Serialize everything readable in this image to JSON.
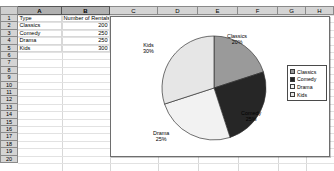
{
  "spreadsheet": {
    "column_headers": [
      "A",
      "B",
      "C",
      "D",
      "E",
      "F",
      "G",
      "H"
    ],
    "selected_columns": [
      "A",
      "B"
    ],
    "row_headers": [
      "1",
      "2",
      "3",
      "4",
      "5",
      "6",
      "7",
      "8",
      "9",
      "10",
      "11",
      "12",
      "13",
      "14",
      "15",
      "16",
      "17",
      "18",
      "19",
      "20"
    ],
    "cells": [
      {
        "row": "1",
        "a": "Type",
        "b": "Number of Rentals"
      },
      {
        "row": "2",
        "a": "Classics",
        "b": "200"
      },
      {
        "row": "3",
        "a": "Comedy",
        "b": "250"
      },
      {
        "row": "4",
        "a": "Drama",
        "b": "250"
      },
      {
        "row": "5",
        "a": "Kids",
        "b": "300"
      }
    ]
  },
  "chart_data": {
    "type": "pie",
    "title": "",
    "categories": [
      "Classics",
      "Comedy",
      "Drama",
      "Kids"
    ],
    "values": [
      200,
      250,
      250,
      300
    ],
    "percentages": [
      20,
      25,
      25,
      30
    ],
    "total": 1000,
    "ylabel": "Number of Rentals",
    "xlabel": "Type",
    "legend_position": "right",
    "grid": false,
    "data_labels": [
      {
        "name": "Classics",
        "text": "Classics",
        "percent_text": "20%",
        "color": "#9a9a9a"
      },
      {
        "name": "Comedy",
        "text": "Comedy",
        "percent_text": "25%",
        "color": "#262626"
      },
      {
        "name": "Drama",
        "text": "Drama",
        "percent_text": "25%",
        "color": "#f2f2f2"
      },
      {
        "name": "Kids",
        "text": "Kids",
        "percent_text": "30%",
        "color": "#e6e6e6"
      }
    ],
    "legend_entries": [
      {
        "label": "Classics",
        "color": "#9a9a9a"
      },
      {
        "label": "Comedy",
        "color": "#262626"
      },
      {
        "label": "Drama",
        "color": "#f2f2f2"
      },
      {
        "label": "Kids",
        "color": "#e6e6e6"
      }
    ]
  }
}
